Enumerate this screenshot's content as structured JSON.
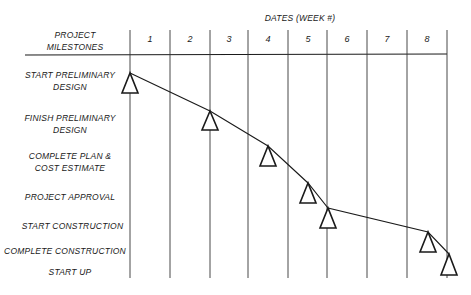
{
  "header": {
    "milestones_title_line1": "PROJECT",
    "milestones_title_line2": "MILESTONES",
    "dates_title": "DATES (WEEK #)"
  },
  "weeks": [
    "1",
    "2",
    "3",
    "4",
    "5",
    "6",
    "7",
    "8"
  ],
  "milestones": [
    {
      "line1": "START PRELIMINARY",
      "line2": "DESIGN",
      "week": 1.0
    },
    {
      "line1": "FINISH PRELIMINARY",
      "line2": "DESIGN",
      "week": 3.0
    },
    {
      "line1": "COMPLETE PLAN &",
      "line2": "COST ESTIMATE",
      "week": 4.45
    },
    {
      "line1": "PROJECT APPROVAL",
      "line2": "",
      "week": 5.45
    },
    {
      "line1": "START CONSTRUCTION",
      "line2": "",
      "week": 5.95
    },
    {
      "line1": "COMPLETE CONSTRUCTION",
      "line2": "",
      "week": 8.5
    },
    {
      "line1": "START UP",
      "line2": "",
      "week": 9.05
    }
  ],
  "colors": {
    "ink": "#1a1a1a",
    "background": "#ffffff"
  }
}
